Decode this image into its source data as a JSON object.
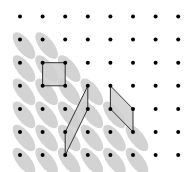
{
  "figure": {
    "grid": {
      "columns": 8,
      "rows": 7
    },
    "colors": {
      "background": "#ffffff",
      "dot": "#000000",
      "ellipse": "#d3d3d3",
      "polygon_fill": "#cfcfcf",
      "polygon_stroke": "#333333"
    },
    "ellipse_cells": [
      [
        0,
        1
      ],
      [
        1,
        1
      ],
      [
        0,
        2
      ],
      [
        1,
        2
      ],
      [
        2,
        2
      ],
      [
        0,
        3
      ],
      [
        1,
        3
      ],
      [
        2,
        3
      ],
      [
        3,
        3
      ],
      [
        0,
        4
      ],
      [
        1,
        4
      ],
      [
        2,
        4
      ],
      [
        3,
        4
      ],
      [
        4,
        4
      ],
      [
        0,
        5
      ],
      [
        1,
        5
      ],
      [
        2,
        5
      ],
      [
        3,
        5
      ],
      [
        4,
        5
      ],
      [
        5,
        5
      ],
      [
        0,
        6
      ],
      [
        1,
        6
      ],
      [
        2,
        6
      ],
      [
        3,
        6
      ],
      [
        4,
        6
      ],
      [
        5,
        6
      ]
    ],
    "polygons": [
      {
        "name": "square",
        "vertices": [
          [
            1,
            2
          ],
          [
            2,
            2
          ],
          [
            2,
            3
          ],
          [
            1,
            3
          ]
        ]
      },
      {
        "name": "left-parallelogram",
        "vertices": [
          [
            3,
            3
          ],
          [
            3,
            4
          ],
          [
            2,
            6
          ],
          [
            2,
            5
          ]
        ]
      },
      {
        "name": "right-parallelogram",
        "vertices": [
          [
            4,
            3
          ],
          [
            5,
            4
          ],
          [
            5,
            5
          ],
          [
            4,
            4
          ]
        ]
      }
    ]
  }
}
